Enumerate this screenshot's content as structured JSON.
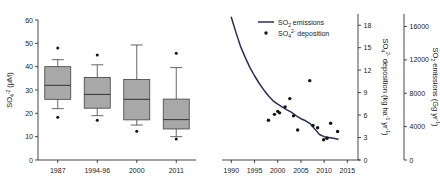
{
  "figure": {
    "panels": [
      "boxplot",
      "timeseries"
    ]
  },
  "chart_data": [
    {
      "type": "box",
      "panel": "left",
      "title": "",
      "xlabel": "",
      "ylabel": "SO4-2 (uM)",
      "ylabel_parts": {
        "base": "SO",
        "sub": "4",
        "sup": "-2",
        "unit": " (μM)"
      },
      "ylim": [
        0,
        60
      ],
      "yticks": [
        0,
        10,
        20,
        30,
        40,
        50,
        60
      ],
      "ytick_labels": [
        "0",
        "10",
        "20",
        "30",
        "40",
        "50",
        "60"
      ],
      "categories": [
        "1987",
        "1994-96",
        "2000",
        "2011"
      ],
      "grid": false,
      "box_fill": "#a8a8a8",
      "box_edge": "#404040",
      "boxes": [
        {
          "label": "1987",
          "whisker_low": 22.0,
          "q1": 26.0,
          "median": 32.0,
          "q3": 40.0,
          "whisker_high": 43.0,
          "outliers": [
            48.0,
            18.3
          ]
        },
        {
          "label": "1994-96",
          "whisker_low": 19.0,
          "q1": 22.2,
          "median": 28.1,
          "q3": 35.4,
          "whisker_high": 40.8,
          "outliers": [
            45.0,
            17.0
          ]
        },
        {
          "label": "2000",
          "whisker_low": 15.0,
          "q1": 17.2,
          "median": 26.0,
          "q3": 34.5,
          "whisker_high": 49.3,
          "outliers": [
            12.3
          ]
        },
        {
          "label": "2011",
          "whisker_low": 10.0,
          "q1": 13.3,
          "median": 17.3,
          "q3": 26.1,
          "whisker_high": 39.6,
          "outliers": [
            45.7,
            9.0
          ]
        }
      ]
    },
    {
      "type": "line",
      "panel": "right",
      "title": "",
      "xlabel": "",
      "xlim": [
        1988,
        2016
      ],
      "xticks": [
        1990,
        1995,
        2000,
        2005,
        2010,
        2015
      ],
      "xtick_labels": [
        "1990",
        "1995",
        "2000",
        "2005",
        "2010",
        "2015"
      ],
      "grid": false,
      "legend_position": "top-right",
      "axes": [
        {
          "id": "deposition",
          "side": "right-inner",
          "label": "SO4 2- deposition (kg ha-1 yr-1)",
          "label_parts": {
            "base": "SO",
            "sub": "4",
            "sup": "2-",
            "text": " deposition (kg ha",
            "sup2": "-1",
            "text2": " yr",
            "sup3": "-1",
            "text3": ")"
          },
          "lim": [
            0,
            19.5
          ],
          "ticks": [
            0,
            3,
            6,
            9,
            12,
            15,
            18
          ],
          "tick_labels": [
            "0",
            "3",
            "6",
            "9",
            "12",
            "15",
            "18"
          ]
        },
        {
          "id": "emissions",
          "side": "right-outer",
          "label": "SO2 emissions (Gg yr-1)",
          "label_parts": {
            "base": "SO",
            "sub": "2",
            "text": " emissions (Gg yr",
            "sup": "-1",
            "text2": ")"
          },
          "lim": [
            0,
            17500
          ],
          "ticks": [
            0,
            4000,
            8000,
            12000,
            16000
          ],
          "tick_labels": [
            "0",
            "4000",
            "8000",
            "12000",
            "16000"
          ]
        }
      ],
      "series": [
        {
          "name": "SO2 emissions",
          "name_parts": {
            "base": "SO",
            "sub": "2",
            "text": " emissions"
          },
          "kind": "line",
          "axis": "emissions",
          "color": "#2b2b5e",
          "x": [
            1990,
            1991,
            1992,
            1993,
            1994,
            1995,
            1996,
            1997,
            1998,
            1999,
            2000,
            2001,
            2002,
            2003,
            2004,
            2005,
            2006,
            2007,
            2008,
            2009,
            2010,
            2011,
            2012,
            2013
          ],
          "values": [
            17100,
            15300,
            13600,
            12300,
            11100,
            10100,
            9200,
            8400,
            7700,
            7100,
            6700,
            6350,
            6000,
            5700,
            5300,
            4950,
            4700,
            4350,
            3700,
            3050,
            2800,
            2700,
            2600,
            2500
          ]
        },
        {
          "name": "SO4 2- deposition",
          "name_parts": {
            "base": "SO",
            "sub": "4",
            "sup": "2-",
            "text": " deposition"
          },
          "kind": "scatter",
          "axis": "deposition",
          "color": "#141414",
          "points": [
            {
              "x": 1998.0,
              "y": 5.3
            },
            {
              "x": 1999.3,
              "y": 6.1
            },
            {
              "x": 2000.0,
              "y": 6.5
            },
            {
              "x": 2000.4,
              "y": 6.3
            },
            {
              "x": 2001.6,
              "y": 7.1
            },
            {
              "x": 2002.6,
              "y": 8.2
            },
            {
              "x": 2003.4,
              "y": 5.9
            },
            {
              "x": 2004.3,
              "y": 4.0
            },
            {
              "x": 2006.9,
              "y": 10.6
            },
            {
              "x": 2007.6,
              "y": 4.6
            },
            {
              "x": 2008.6,
              "y": 4.3
            },
            {
              "x": 2009.9,
              "y": 2.7
            },
            {
              "x": 2010.6,
              "y": 2.9
            },
            {
              "x": 2011.4,
              "y": 4.9
            },
            {
              "x": 2012.9,
              "y": 3.8
            }
          ]
        }
      ]
    }
  ]
}
